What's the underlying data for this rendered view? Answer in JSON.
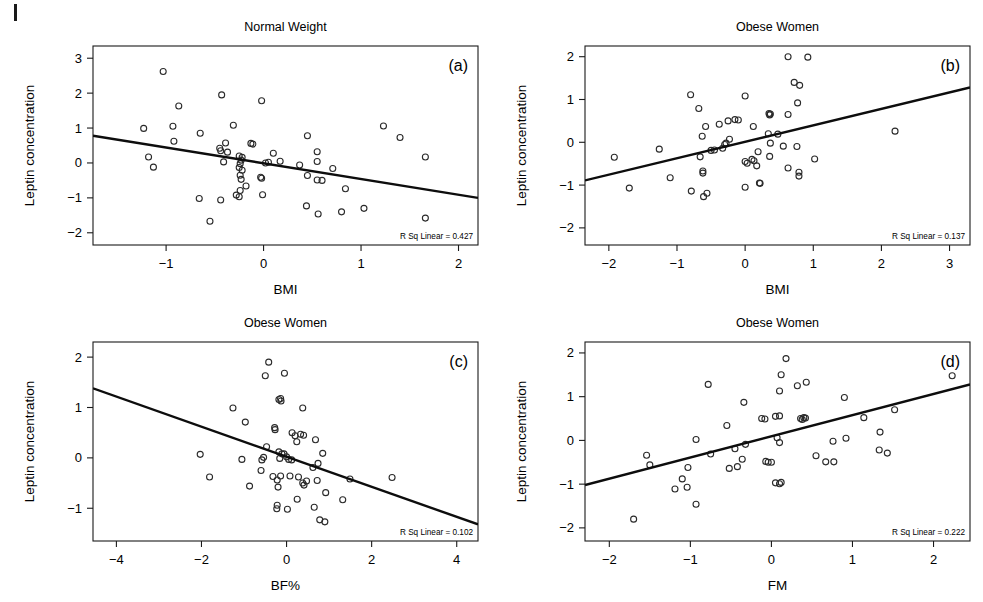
{
  "figure": {
    "background": "#ffffff",
    "point_color": "#2a2a2a",
    "line_color": "#0d0d0d",
    "corner_mark": "|"
  },
  "chart_data": [
    {
      "id": "panel-a",
      "type": "scatter",
      "title": "Normal Weight",
      "panel_letter": "(a)",
      "xlabel": "BMI",
      "ylabel": "Leptin concentration",
      "annotation": "R Sq Linear = 0.427",
      "r_squared": 0.427,
      "xlim": [
        -1.75,
        2.2
      ],
      "ylim": [
        -2.35,
        3.35
      ],
      "xticks": [
        -1,
        0,
        1,
        2
      ],
      "yticks": [
        -2,
        -1,
        0,
        1,
        2,
        3
      ],
      "xticklabels": [
        "−1",
        "0",
        "1",
        "2"
      ],
      "yticklabels": [
        "−2",
        "−1",
        "0",
        "1",
        "2",
        "3"
      ],
      "grid": false,
      "fit_line": {
        "x0": -1.75,
        "y0": 0.78,
        "x1": 2.2,
        "y1": -1.0
      },
      "points": [
        [
          -1.03,
          2.62
        ],
        [
          -0.87,
          1.63
        ],
        [
          -0.43,
          1.95
        ],
        [
          -0.02,
          1.78
        ],
        [
          -1.23,
          0.99
        ],
        [
          -0.93,
          1.05
        ],
        [
          -0.92,
          0.62
        ],
        [
          -0.65,
          0.85
        ],
        [
          -0.31,
          1.08
        ],
        [
          -0.39,
          0.57
        ],
        [
          -0.13,
          0.56
        ],
        [
          -0.45,
          0.42
        ],
        [
          -0.44,
          0.35
        ],
        [
          -0.37,
          0.31
        ],
        [
          -0.25,
          0.2
        ],
        [
          -0.22,
          0.16
        ],
        [
          -0.23,
          0.08
        ],
        [
          -0.41,
          0.03
        ],
        [
          -0.24,
          -0.02
        ],
        [
          -0.25,
          -0.13
        ],
        [
          -1.13,
          -0.12
        ],
        [
          -1.18,
          0.17
        ],
        [
          0.45,
          0.78
        ],
        [
          1.23,
          1.06
        ],
        [
          1.4,
          0.73
        ],
        [
          1.66,
          0.17
        ],
        [
          0.55,
          0.32
        ],
        [
          0.55,
          0.04
        ],
        [
          0.1,
          0.28
        ],
        [
          0.17,
          0.05
        ],
        [
          0.05,
          0.02
        ],
        [
          0.37,
          -0.06
        ],
        [
          0.71,
          -0.16
        ],
        [
          0.45,
          -0.36
        ],
        [
          0.55,
          -0.49
        ],
        [
          0.6,
          -0.5
        ],
        [
          0.84,
          -0.74
        ],
        [
          -0.24,
          -0.35
        ],
        [
          -0.23,
          -0.47
        ],
        [
          -0.03,
          -0.41
        ],
        [
          -0.02,
          -0.44
        ],
        [
          -0.18,
          -0.66
        ],
        [
          -0.24,
          -0.79
        ],
        [
          -0.25,
          -0.97
        ],
        [
          -0.28,
          -0.92
        ],
        [
          -0.01,
          -0.91
        ],
        [
          -0.66,
          -1.02
        ],
        [
          -0.44,
          -1.06
        ],
        [
          0.44,
          -1.23
        ],
        [
          0.56,
          -1.46
        ],
        [
          0.8,
          -1.4
        ],
        [
          1.03,
          -1.3
        ],
        [
          1.66,
          -1.58
        ],
        [
          -0.55,
          -1.67
        ],
        [
          -0.11,
          0.54
        ],
        [
          0.02,
          0.0
        ],
        [
          -0.22,
          -0.21
        ]
      ]
    },
    {
      "id": "panel-b",
      "type": "scatter",
      "title": "Obese Women",
      "panel_letter": "(b)",
      "xlabel": "BMI",
      "ylabel": "Leptin concentration",
      "annotation": "R Sq Linear = 0.137",
      "r_squared": 0.137,
      "xlim": [
        -2.35,
        3.3
      ],
      "ylim": [
        -2.4,
        2.25
      ],
      "xticks": [
        -2,
        -1,
        0,
        1,
        2,
        3
      ],
      "yticks": [
        -2,
        -1,
        0,
        1,
        2
      ],
      "xticklabels": [
        "−2",
        "−1",
        "0",
        "1",
        "2",
        "3"
      ],
      "yticklabels": [
        "−2",
        "−1",
        "0",
        "1",
        "2"
      ],
      "grid": false,
      "fit_line": {
        "x0": -2.35,
        "y0": -0.89,
        "x1": 3.3,
        "y1": 1.28
      },
      "points": [
        [
          0.63,
          2.0
        ],
        [
          0.92,
          1.99
        ],
        [
          0.72,
          1.4
        ],
        [
          0.8,
          1.33
        ],
        [
          -0.8,
          1.11
        ],
        [
          0.0,
          1.08
        ],
        [
          0.77,
          0.92
        ],
        [
          -0.68,
          0.79
        ],
        [
          0.35,
          0.67
        ],
        [
          0.37,
          0.66
        ],
        [
          0.36,
          0.64
        ],
        [
          0.63,
          0.65
        ],
        [
          -0.15,
          0.53
        ],
        [
          -0.1,
          0.52
        ],
        [
          -0.25,
          0.5
        ],
        [
          0.12,
          0.37
        ],
        [
          -0.58,
          0.37
        ],
        [
          -0.38,
          0.42
        ],
        [
          -0.63,
          0.14
        ],
        [
          0.34,
          0.2
        ],
        [
          0.48,
          0.19
        ],
        [
          2.2,
          0.26
        ],
        [
          -0.23,
          0.07
        ],
        [
          -0.28,
          -0.02
        ],
        [
          -0.3,
          -0.05
        ],
        [
          0.37,
          -0.02
        ],
        [
          0.56,
          -0.09
        ],
        [
          0.76,
          -0.1
        ],
        [
          -1.26,
          -0.16
        ],
        [
          -0.45,
          -0.18
        ],
        [
          -0.5,
          -0.19
        ],
        [
          -0.33,
          -0.14
        ],
        [
          0.19,
          -0.22
        ],
        [
          0.36,
          -0.33
        ],
        [
          -1.92,
          -0.35
        ],
        [
          -0.66,
          -0.34
        ],
        [
          0.0,
          -0.45
        ],
        [
          0.1,
          -0.4
        ],
        [
          0.13,
          -0.43
        ],
        [
          0.17,
          -0.55
        ],
        [
          1.02,
          -0.39
        ],
        [
          0.63,
          -0.6
        ],
        [
          0.79,
          -0.7
        ],
        [
          0.79,
          -0.79
        ],
        [
          -0.62,
          -0.67
        ],
        [
          -0.62,
          -0.72
        ],
        [
          -1.1,
          -0.83
        ],
        [
          0.0,
          -1.05
        ],
        [
          0.21,
          -0.95
        ],
        [
          -1.7,
          -1.07
        ],
        [
          -0.79,
          -1.14
        ],
        [
          -0.61,
          -1.27
        ],
        [
          -0.56,
          -1.19
        ],
        [
          0.22,
          -0.96
        ],
        [
          0.03,
          -0.49
        ]
      ]
    },
    {
      "id": "panel-c",
      "type": "scatter",
      "title": "Obese Women",
      "panel_letter": "(c)",
      "xlabel": "BF%",
      "ylabel": "Leptin concentration",
      "annotation": "R Sq Linear = 0.102",
      "r_squared": 0.102,
      "xlim": [
        -4.55,
        4.5
      ],
      "ylim": [
        -1.65,
        2.3
      ],
      "xticks": [
        -4,
        -2,
        0,
        2,
        4
      ],
      "yticks": [
        -1,
        0,
        1,
        2
      ],
      "xticklabels": [
        "−4",
        "−2",
        "0",
        "2",
        "4"
      ],
      "yticklabels": [
        "−1",
        "0",
        "1",
        "2"
      ],
      "grid": false,
      "fit_line": {
        "x0": -4.55,
        "y0": 1.38,
        "x1": 4.5,
        "y1": -1.32
      },
      "points": [
        [
          -0.42,
          1.9
        ],
        [
          -0.5,
          1.63
        ],
        [
          -0.05,
          1.68
        ],
        [
          -0.18,
          1.16
        ],
        [
          -0.14,
          1.18
        ],
        [
          -0.13,
          1.13
        ],
        [
          -1.26,
          0.99
        ],
        [
          0.38,
          0.99
        ],
        [
          -0.97,
          0.71
        ],
        [
          -0.28,
          0.6
        ],
        [
          -0.27,
          0.56
        ],
        [
          0.13,
          0.5
        ],
        [
          0.33,
          0.47
        ],
        [
          0.4,
          0.45
        ],
        [
          0.2,
          0.44
        ],
        [
          0.24,
          0.32
        ],
        [
          0.68,
          0.36
        ],
        [
          -0.47,
          0.22
        ],
        [
          -0.18,
          0.12
        ],
        [
          -0.11,
          0.08
        ],
        [
          -2.03,
          0.07
        ],
        [
          0.85,
          0.09
        ],
        [
          -0.06,
          0.08
        ],
        [
          0.0,
          0.02
        ],
        [
          -0.54,
          0.01
        ],
        [
          -0.58,
          -0.04
        ],
        [
          -1.05,
          -0.03
        ],
        [
          -0.16,
          -0.01
        ],
        [
          0.12,
          -0.04
        ],
        [
          0.74,
          -0.11
        ],
        [
          0.62,
          -0.19
        ],
        [
          -0.6,
          -0.25
        ],
        [
          -0.32,
          -0.37
        ],
        [
          -0.14,
          -0.36
        ],
        [
          0.08,
          -0.36
        ],
        [
          0.28,
          -0.38
        ],
        [
          2.48,
          -0.39
        ],
        [
          -1.81,
          -0.38
        ],
        [
          -0.22,
          -0.44
        ],
        [
          0.47,
          -0.46
        ],
        [
          0.72,
          -0.45
        ],
        [
          0.38,
          -0.5
        ],
        [
          0.41,
          -0.54
        ],
        [
          -0.87,
          -0.56
        ],
        [
          -0.2,
          -0.58
        ],
        [
          0.92,
          -0.69
        ],
        [
          1.32,
          -0.83
        ],
        [
          0.25,
          -0.82
        ],
        [
          -0.22,
          -0.94
        ],
        [
          -0.23,
          -1.01
        ],
        [
          0.02,
          -1.02
        ],
        [
          0.65,
          -0.98
        ],
        [
          0.78,
          -1.23
        ],
        [
          0.9,
          -1.27
        ],
        [
          1.49,
          -0.42
        ],
        [
          0.05,
          -0.03
        ]
      ]
    },
    {
      "id": "panel-d",
      "type": "scatter",
      "title": "Obese Women",
      "panel_letter": "(d)",
      "xlabel": "FM",
      "ylabel": "Leptin concentration",
      "annotation": "R Sq Linear = 0.222",
      "r_squared": 0.222,
      "xlim": [
        -2.3,
        2.45
      ],
      "ylim": [
        -2.3,
        2.25
      ],
      "xticks": [
        -2,
        -1,
        0,
        1,
        2
      ],
      "yticks": [
        -2,
        -1,
        0,
        1,
        2
      ],
      "xticklabels": [
        "−2",
        "−1",
        "0",
        "1",
        "2"
      ],
      "yticklabels": [
        "−2",
        "−1",
        "0",
        "1",
        "2"
      ],
      "grid": false,
      "fit_line": {
        "x0": -2.3,
        "y0": -1.02,
        "x1": 2.45,
        "y1": 1.28
      },
      "points": [
        [
          0.18,
          1.87
        ],
        [
          2.23,
          1.48
        ],
        [
          0.12,
          1.5
        ],
        [
          -0.78,
          1.28
        ],
        [
          0.32,
          1.25
        ],
        [
          0.43,
          1.33
        ],
        [
          0.1,
          1.13
        ],
        [
          0.9,
          0.98
        ],
        [
          -0.34,
          0.87
        ],
        [
          -0.12,
          0.5
        ],
        [
          -0.08,
          0.49
        ],
        [
          0.05,
          0.55
        ],
        [
          0.1,
          0.56
        ],
        [
          0.36,
          0.5
        ],
        [
          0.4,
          0.52
        ],
        [
          0.38,
          0.48
        ],
        [
          -0.55,
          0.34
        ],
        [
          1.14,
          0.52
        ],
        [
          1.52,
          0.7
        ],
        [
          1.34,
          0.19
        ],
        [
          -0.93,
          0.02
        ],
        [
          0.07,
          0.06
        ],
        [
          -0.32,
          -0.09
        ],
        [
          0.1,
          -0.05
        ],
        [
          -0.75,
          -0.31
        ],
        [
          0.76,
          -0.02
        ],
        [
          0.92,
          0.05
        ],
        [
          -0.45,
          -0.19
        ],
        [
          1.33,
          -0.22
        ],
        [
          1.43,
          -0.29
        ],
        [
          -1.54,
          -0.34
        ],
        [
          0.55,
          -0.35
        ],
        [
          -0.36,
          -0.43
        ],
        [
          -0.07,
          -0.48
        ],
        [
          -0.04,
          -0.5
        ],
        [
          0.67,
          -0.49
        ],
        [
          0.77,
          -0.49
        ],
        [
          -1.5,
          -0.56
        ],
        [
          -0.52,
          -0.64
        ],
        [
          -0.42,
          -0.6
        ],
        [
          -1.03,
          -0.62
        ],
        [
          -1.1,
          -0.88
        ],
        [
          0.05,
          -0.97
        ],
        [
          0.1,
          -0.99
        ],
        [
          0.12,
          -0.96
        ],
        [
          -1.19,
          -1.11
        ],
        [
          -1.04,
          -1.07
        ],
        [
          -0.93,
          -1.46
        ],
        [
          -1.7,
          -1.8
        ],
        [
          0.0,
          -0.5
        ],
        [
          0.42,
          0.51
        ]
      ]
    }
  ]
}
